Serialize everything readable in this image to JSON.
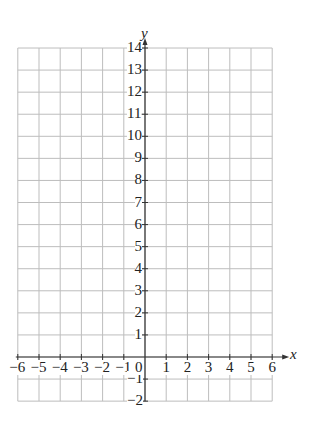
{
  "chart_data": {
    "type": "grid",
    "title": "",
    "xlabel": "x",
    "ylabel": "y",
    "xlim": [
      -6,
      6
    ],
    "ylim": [
      -2,
      14
    ],
    "x_ticks": [
      -6,
      -5,
      -4,
      -3,
      -2,
      -1,
      1,
      2,
      3,
      4,
      5,
      6
    ],
    "y_ticks": [
      14,
      13,
      12,
      11,
      10,
      9,
      8,
      7,
      6,
      5,
      4,
      3,
      2,
      1,
      -1,
      -2
    ],
    "origin_label": "0",
    "grid": true,
    "grid_color": "#bdbdbd",
    "axis_color": "#333333",
    "series": []
  }
}
